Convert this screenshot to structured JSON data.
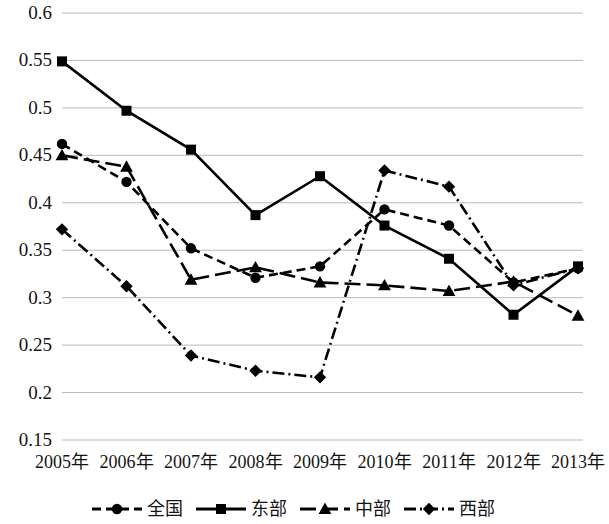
{
  "chart_data": {
    "type": "line",
    "title": "",
    "xlabel": "",
    "ylabel": "",
    "grid": true,
    "legend_position": "bottom",
    "categories": [
      "2005年",
      "2006年",
      "2007年",
      "2008年",
      "2009年",
      "2010年",
      "2011年",
      "2012年",
      "2013年"
    ],
    "ylim": [
      0.15,
      0.6
    ],
    "ytick_labels": [
      "0.6",
      "0.55",
      "0.5",
      "0.45",
      "0.4",
      "0.35",
      "0.3",
      "0.25",
      "0.2",
      "0.15"
    ],
    "ytick_values": [
      0.6,
      0.55,
      0.5,
      0.45,
      0.4,
      0.35,
      0.3,
      0.25,
      0.2,
      0.15
    ],
    "series": [
      {
        "name": "全国",
        "marker": "circle",
        "line_style": "dashed",
        "color": "#000000",
        "values": [
          0.462,
          0.422,
          0.352,
          0.321,
          0.333,
          0.393,
          0.376,
          0.316,
          0.331
        ]
      },
      {
        "name": "东部",
        "marker": "square",
        "line_style": "solid",
        "color": "#000000",
        "values": [
          0.549,
          0.497,
          0.456,
          0.387,
          0.428,
          0.376,
          0.341,
          0.282,
          0.333
        ]
      },
      {
        "name": "中部",
        "marker": "triangle",
        "line_style": "long-dash",
        "color": "#000000",
        "values": [
          0.45,
          0.438,
          0.319,
          0.332,
          0.316,
          0.313,
          0.307,
          0.317,
          0.281
        ]
      },
      {
        "name": "西部",
        "marker": "diamond",
        "line_style": "dash-dot",
        "color": "#000000",
        "values": [
          0.372,
          0.312,
          0.239,
          0.223,
          0.216,
          0.434,
          0.417,
          0.313,
          0.331
        ]
      }
    ]
  },
  "legend": {
    "entries": [
      {
        "label": "全国",
        "key_name": "legend-key-quanguo"
      },
      {
        "label": "东部",
        "key_name": "legend-key-dongbu"
      },
      {
        "label": "中部",
        "key_name": "legend-key-zhongbu"
      },
      {
        "label": "西部",
        "key_name": "legend-key-xibu"
      }
    ]
  }
}
